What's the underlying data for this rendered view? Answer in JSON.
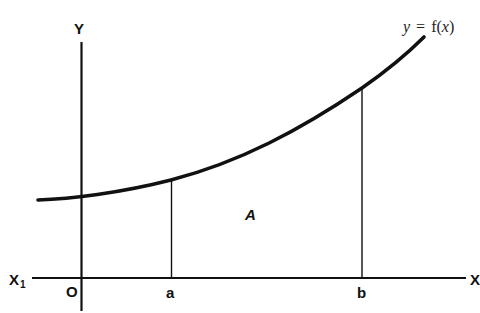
{
  "diagram": {
    "colors": {
      "stroke": "#111111",
      "background": "#ffffff"
    },
    "axes": {
      "y_label": "Y",
      "x_label": "X",
      "x_neg_label": "X",
      "x_neg_subscript": "1",
      "origin_label": "O"
    },
    "curve": {
      "label_y": "y",
      "label_eq": "=",
      "label_f": "f(",
      "label_x": "x",
      "label_close": ")"
    },
    "bounds": {
      "lower": "a",
      "upper": "b"
    },
    "region_label": "A"
  }
}
